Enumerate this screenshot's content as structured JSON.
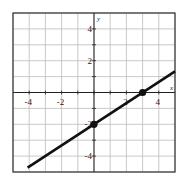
{
  "chart_data": {
    "type": "line",
    "title": "",
    "xlabel": "x",
    "ylabel": "y",
    "xlim": [
      -5,
      5
    ],
    "ylim": [
      -5,
      5
    ],
    "grid": true,
    "x_ticks": [
      -4,
      -2,
      2,
      4
    ],
    "y_ticks": [
      4,
      2,
      -2,
      -4
    ],
    "x_tick_labels": [
      "-4",
      "-2",
      "2",
      "4"
    ],
    "y_tick_labels": [
      "4",
      "2",
      "-2",
      "-4"
    ],
    "series": [
      {
        "name": "line",
        "equation": "y = (2/3)x - 2",
        "x": [
          -4.1,
          5
        ],
        "y": [
          -4.73,
          1.33
        ]
      }
    ],
    "points": [
      {
        "x": 0,
        "y": -2
      },
      {
        "x": 3,
        "y": 0
      }
    ]
  },
  "labels": {
    "x_axis": "x",
    "y_axis": "y"
  }
}
